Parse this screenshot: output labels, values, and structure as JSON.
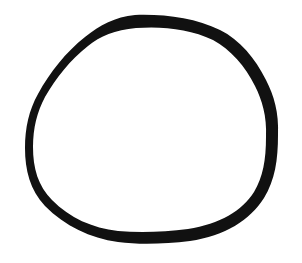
{
  "image": {
    "description": "hand-drawn black ring on white background",
    "background_color": "#ffffff",
    "stroke_color": "#111111",
    "shape": "ring-icon"
  }
}
